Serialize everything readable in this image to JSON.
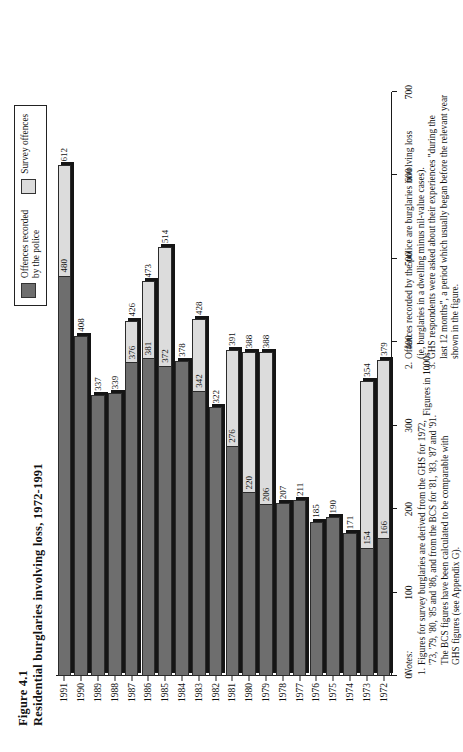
{
  "figure": {
    "number": "Figure 4.1",
    "title": "Residential burglaries involving loss, 1972-1991"
  },
  "legend": {
    "items": [
      {
        "key": "police",
        "label_line1": "Offences recorded",
        "label_line2": "by the police",
        "color": "#6e6e6e"
      },
      {
        "key": "survey",
        "label_line1": "Survey offences",
        "label_line2": "",
        "color": "#dcdcdc"
      }
    ]
  },
  "axis": {
    "value_label": "Figures in 1000s",
    "ticks": [
      "0",
      "100",
      "200",
      "300",
      "400",
      "500",
      "600",
      "700"
    ],
    "max": 700
  },
  "notes": {
    "heading": "Notes:",
    "items": [
      {
        "number": "1.",
        "lines": [
          "Figures for survey burglaries are derived from the GHS for 1972,",
          "'73, '79, '80, '85 and '86, and from the BCS for '81, '83, '87 and '91.",
          "The BCS figures have been calculated to be comparable with",
          "GHS figures (see Appendix G)."
        ]
      },
      {
        "number": "2.",
        "lines": [
          "Offences recorded by the police are burglaries involving loss",
          "(ie, burglaries in a dwelling minus nil-value cases)."
        ]
      },
      {
        "number": "3.",
        "lines": [
          "GHS respondents were asked about their experiences \"during the",
          "last 12 months\", a period which usually began before the relevant year",
          "shown in the figure."
        ]
      }
    ]
  },
  "chart_data": {
    "type": "bar",
    "title": "Residential burglaries involving loss, 1972-1991",
    "orientation": "horizontal",
    "xlabel": "Figures in 1000s",
    "ylabel": "",
    "xlim": [
      0,
      700
    ],
    "grid": false,
    "legend_position": "top-right",
    "categories": [
      "1972",
      "1973",
      "1974",
      "1975",
      "1976",
      "1977",
      "1978",
      "1979",
      "1980",
      "1981",
      "1982",
      "1983",
      "1984",
      "1985",
      "1986",
      "1987",
      "1988",
      "1989",
      "1990",
      "1991"
    ],
    "series": [
      {
        "name": "Survey offences",
        "color": "#dcdcdc",
        "values": [
          379,
          354,
          null,
          null,
          null,
          null,
          null,
          388,
          388,
          391,
          null,
          428,
          null,
          514,
          473,
          426,
          null,
          null,
          null,
          612
        ]
      },
      {
        "name": "Offences recorded by the police",
        "color": "#6e6e6e",
        "values": [
          166,
          154,
          171,
          190,
          185,
          211,
          207,
          206,
          220,
          276,
          322,
          342,
          378,
          372,
          381,
          376,
          339,
          337,
          408,
          480
        ]
      }
    ]
  }
}
